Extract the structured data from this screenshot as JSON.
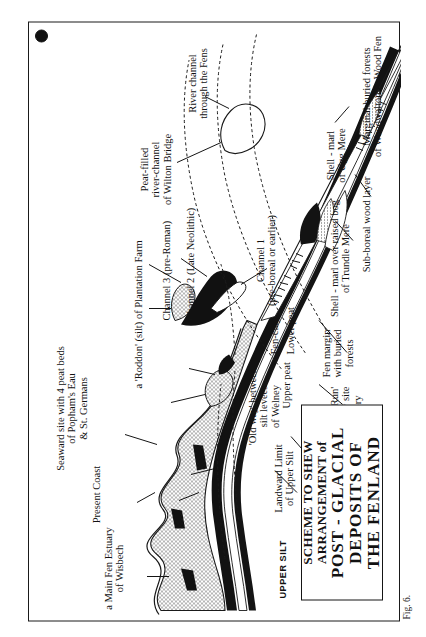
{
  "figure": {
    "caption": "Fig. 6.",
    "corner_mark": "",
    "title_lines": [
      "SCHEME TO SHEW",
      "ARRANGEMENT of",
      "POST - GLACIAL",
      "DEPOSITS  OF",
      "THE FENLAND"
    ]
  },
  "colors": {
    "ink": "#151515",
    "paper": "#ffffff",
    "silt_stipple": "#9a9a9a",
    "peat_solid": "#111111"
  },
  "strata_keys": [
    {
      "name": "upper-silt",
      "label": "UPPER SILT"
    },
    {
      "name": "upper-peat",
      "label": "UPPER\nPEAT"
    }
  ],
  "annotations": {
    "seaward": [
      {
        "name": "main-fen-estuary",
        "text": "a Main Fen Estuary\nof Wisbech"
      },
      {
        "name": "present-coast",
        "text": "Present Coast"
      },
      {
        "name": "seaward-site-peat-beds",
        "text": "Seaward site with 4 peat beds\nof Popham's Eau\n& St. Germans"
      }
    ],
    "central": [
      {
        "name": "old-way-welney",
        "text": "'Old way' between\nsilt levees\nof Welney"
      },
      {
        "name": "upper-peat-layer",
        "text": "Upper peat"
      },
      {
        "name": "fen-clay-layer",
        "text": "Fen-clay"
      },
      {
        "name": "lower-peat-layer",
        "text": "Lower peat"
      },
      {
        "name": "old-run-nancy",
        "text": "An 'Old Run'\nof Nancy site\nSouthery"
      }
    ],
    "landward": [
      {
        "name": "landward-limit-upper-silt",
        "text": "Landward Limit\nof Upper Silt"
      },
      {
        "name": "upper-peat-removed",
        "text": "Upper peat removed &\nfen-clay exposed"
      },
      {
        "name": "fen-margin-buried-forests",
        "text": "Fen margin\nwith buried\nforests"
      },
      {
        "name": "shell-marl-trundle-mere",
        "text": "Shell - marl over raised bog\nof Trundle Mere"
      },
      {
        "name": "sub-boreal-wood-layer",
        "text": "Sub-boreal wood layer"
      },
      {
        "name": "shell-marl-ugg-mere",
        "text": "Shell - marl\nof Ugg Mere"
      },
      {
        "name": "marginal-buried-forests",
        "text": "Marginal buried forests\nof Woodwalton & Wood Fen"
      }
    ],
    "channels": [
      {
        "name": "roddon-plantation-farm",
        "text": "a 'Roddon' (silt) of Plantation Farm",
        "italic_part": "silt"
      },
      {
        "name": "channel-3",
        "text": "Channel 3 (pre-Roman)"
      },
      {
        "name": "channel-2",
        "text": "Channel 2 (Late Neolithic)"
      },
      {
        "name": "channel-1",
        "text": "Channel 1\n(pre-boreal or earlier)"
      },
      {
        "name": "peat-filled-river-channel-wilton",
        "text": "Peat-filled\nriver-channel\nof Wilton Bridge"
      },
      {
        "name": "river-channel-through-fens",
        "text": "River channel\nthrough the Fens"
      }
    ]
  }
}
